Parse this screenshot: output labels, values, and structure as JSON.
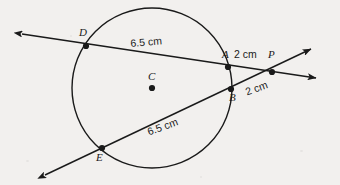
{
  "figure": {
    "background_color": "#f2f0ee",
    "stroke_color": "#1a1a1a",
    "width": 340,
    "height": 185
  },
  "circle": {
    "center_label": "C",
    "center_x": 152,
    "center_y": 88,
    "radius": 80
  },
  "points": [
    {
      "id": "D",
      "label": "D",
      "x": 86,
      "y": 46,
      "label_x": 79,
      "label_y": 27
    },
    {
      "id": "A",
      "label": "A",
      "x": 228,
      "y": 67,
      "label_x": 222,
      "label_y": 49
    },
    {
      "id": "P",
      "label": "P",
      "x": 272,
      "y": 72,
      "label_x": 268,
      "label_y": 49
    },
    {
      "id": "B",
      "label": "B",
      "x": 231,
      "y": 89,
      "label_x": 229,
      "label_y": 92
    },
    {
      "id": "E",
      "label": "E",
      "x": 102,
      "y": 148,
      "label_x": 96,
      "label_y": 152
    }
  ],
  "measurements": [
    {
      "id": "DA",
      "text": "6.5 cm",
      "x": 130,
      "y": 38,
      "rotation": -5
    },
    {
      "id": "AP",
      "text": "2 cm",
      "x": 234,
      "y": 49,
      "rotation": 0
    },
    {
      "id": "BP",
      "text": "2 cm",
      "x": 244,
      "y": 87,
      "rotation": -20
    },
    {
      "id": "EB",
      "text": "6.5 cm",
      "x": 146,
      "y": 127,
      "rotation": -20
    }
  ],
  "lines": [
    {
      "id": "secant-DAP",
      "description": "secant through D, A to external point P",
      "x1": 22,
      "y1": 34,
      "x2": 316,
      "y2": 78,
      "arrow_start": true,
      "arrow_end": true
    },
    {
      "id": "secant-EBP",
      "description": "secant through E, B to external point P",
      "x1": 45,
      "y1": 175,
      "x2": 311,
      "y2": 49,
      "arrow_start": true,
      "arrow_end": true
    }
  ],
  "center_label": {
    "text": "C",
    "x": 148,
    "y": 71
  }
}
